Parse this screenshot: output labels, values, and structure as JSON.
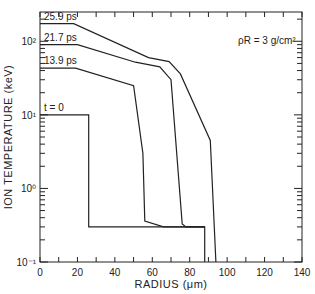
{
  "chart_data": {
    "type": "line",
    "title": "",
    "xlabel": "RADIUS (μm)",
    "ylabel": "ION TEMPERATURE (keV)",
    "xlim": [
      0,
      140
    ],
    "ylim": [
      0.1,
      250
    ],
    "yscale": "log",
    "grid": false,
    "legend_position": "inline labels",
    "x_ticks": [
      0,
      20,
      40,
      60,
      80,
      100,
      120,
      140
    ],
    "x_tick_labels": [
      "0",
      "20",
      "40",
      "60",
      "80",
      "100",
      "120",
      "140"
    ],
    "y_ticks": [
      0.1,
      1,
      10,
      100
    ],
    "y_tick_labels": [
      "10⁻¹",
      "10⁰",
      "10¹",
      "10²"
    ],
    "annotations": [
      {
        "text": "ρR = 3 g/cm²",
        "x": 118,
        "y": 170
      }
    ],
    "series": [
      {
        "name": "t = 0",
        "label": "t = 0",
        "x": [
          0,
          26,
          26,
          88,
          88
        ],
        "y": [
          10,
          10,
          0.3,
          0.3,
          0.1
        ]
      },
      {
        "name": "13.9 ps",
        "label": "13.9 ps",
        "x": [
          0,
          19,
          50,
          55,
          56,
          66,
          88
        ],
        "y": [
          43,
          43,
          25,
          3,
          0.36,
          0.3,
          0.3
        ]
      },
      {
        "name": "21.7 ps",
        "label": "21.7 ps",
        "x": [
          0,
          20,
          51,
          64,
          70,
          76,
          78,
          88
        ],
        "y": [
          90,
          90,
          52,
          45,
          30,
          0.33,
          0.3,
          0.3
        ]
      },
      {
        "name": "25.9 ps",
        "label": "25.9 ps",
        "x": [
          0,
          18,
          58,
          69,
          75,
          91,
          94
        ],
        "y": [
          174,
          174,
          60,
          53,
          36,
          4.5,
          0.1
        ]
      }
    ]
  }
}
